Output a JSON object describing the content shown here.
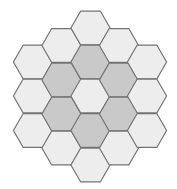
{
  "diagram": {
    "type": "hexagonal-grid",
    "orientation": "flat-top",
    "background": "#ffffff",
    "colors": {
      "light": "#ededed",
      "dark": "#c9c9c9",
      "stroke": "#737373"
    },
    "side": 19.6,
    "columns": [
      {
        "cx": 33,
        "cells": [
          {
            "cy": 62,
            "shade": "light"
          },
          {
            "cy": 96,
            "shade": "light"
          },
          {
            "cy": 130.5,
            "shade": "light"
          }
        ]
      },
      {
        "cx": 61.5,
        "cells": [
          {
            "cy": 45.5,
            "shade": "light"
          },
          {
            "cy": 80,
            "shade": "dark"
          },
          {
            "cy": 114,
            "shade": "dark"
          },
          {
            "cy": 148,
            "shade": "light"
          }
        ]
      },
      {
        "cx": 90.5,
        "cells": [
          {
            "cy": 28,
            "shade": "light"
          },
          {
            "cy": 62,
            "shade": "dark"
          },
          {
            "cy": 96,
            "shade": "light"
          },
          {
            "cy": 130.5,
            "shade": "dark"
          },
          {
            "cy": 165,
            "shade": "light"
          }
        ]
      },
      {
        "cx": 119,
        "cells": [
          {
            "cy": 45.5,
            "shade": "light"
          },
          {
            "cy": 80,
            "shade": "dark"
          },
          {
            "cy": 114,
            "shade": "dark"
          },
          {
            "cy": 148,
            "shade": "light"
          }
        ]
      },
      {
        "cx": 147,
        "cells": [
          {
            "cy": 62,
            "shade": "light"
          },
          {
            "cy": 96,
            "shade": "light"
          },
          {
            "cy": 130.5,
            "shade": "light"
          }
        ]
      }
    ]
  }
}
